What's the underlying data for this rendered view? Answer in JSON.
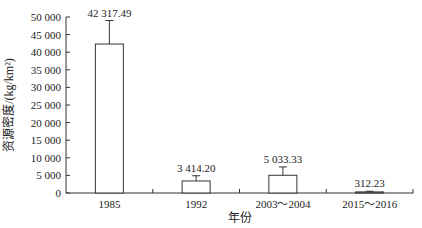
{
  "chart_data": {
    "type": "bar",
    "title": "",
    "xlabel": "年份",
    "ylabel": "资源密度/(kg/km²)",
    "categories": [
      "1985",
      "1992",
      "2003～2004",
      "2015～2016"
    ],
    "values": [
      42317.49,
      3414.2,
      5033.33,
      312.23
    ],
    "value_labels": [
      "42 317.49",
      "3 414.20",
      "5 033.33",
      "312.23"
    ],
    "error_upper": [
      49000,
      4900,
      7400,
      500
    ],
    "ylim": [
      0,
      50000
    ],
    "yticks": [
      0,
      5000,
      10000,
      15000,
      20000,
      25000,
      30000,
      35000,
      40000,
      45000,
      50000
    ],
    "ytick_labels": [
      "0",
      "5 000",
      "10 000",
      "15 000",
      "20 000",
      "25 000",
      "30 000",
      "35 000",
      "40 000",
      "45 000",
      "50 000"
    ],
    "grid": false,
    "legend": null,
    "bar_fill": "#ffffff",
    "bar_stroke": "#333333"
  }
}
